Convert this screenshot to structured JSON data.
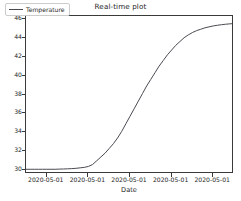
{
  "chart_data": {
    "type": "line",
    "title": "Real-time plot",
    "xlabel": "Date",
    "ylabel": "",
    "grid": false,
    "legend_position": "upper left",
    "ylim": [
      29.6,
      46.3
    ],
    "yticks": [
      30,
      32,
      34,
      36,
      38,
      40,
      42,
      44,
      46
    ],
    "xticks": [
      "2020-05-01",
      "2020-05-01",
      "2020-05-01",
      "2020-05-01",
      "2020-05-01"
    ],
    "line_color": "#4a4a52",
    "series": [
      {
        "name": "Temperature",
        "x": [
          0,
          2,
          4,
          6,
          8,
          10,
          12,
          14,
          16,
          18,
          20,
          22,
          24,
          26,
          28,
          30,
          32,
          34,
          36,
          38,
          40,
          42,
          44,
          46,
          48,
          50,
          52,
          54,
          56,
          58,
          60,
          62,
          64,
          66,
          68,
          70,
          72,
          74,
          76,
          78,
          80,
          82,
          84,
          86,
          88,
          90,
          92,
          94,
          96,
          98,
          100
        ],
        "values": [
          30.1,
          30.1,
          30.1,
          30.1,
          30.1,
          30.1,
          30.1,
          30.1,
          30.12,
          30.13,
          30.15,
          30.17,
          30.2,
          30.25,
          30.3,
          30.4,
          30.6,
          31.0,
          31.4,
          31.8,
          32.3,
          32.8,
          33.4,
          34.1,
          34.9,
          35.7,
          36.5,
          37.3,
          38.1,
          38.9,
          39.6,
          40.3,
          41.0,
          41.6,
          42.2,
          42.7,
          43.2,
          43.6,
          44.0,
          44.3,
          44.55,
          44.75,
          44.9,
          45.05,
          45.15,
          45.25,
          45.32,
          45.38,
          45.43,
          45.47,
          45.5
        ]
      }
    ]
  },
  "legend": {
    "label": "Temperature"
  }
}
